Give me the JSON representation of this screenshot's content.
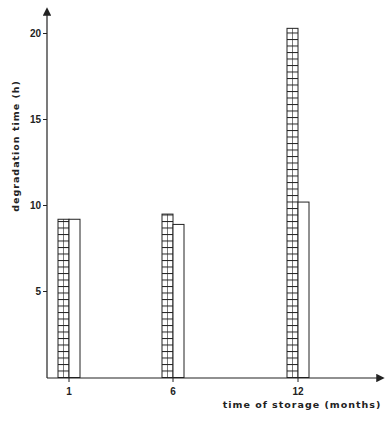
{
  "chart_data": {
    "type": "bar",
    "title": "",
    "xlabel": "time of storage (months)",
    "ylabel": "degradation time (h)",
    "categories": [
      "1",
      "6",
      "12"
    ],
    "series": [
      {
        "name": "hatched",
        "pattern": "horizontal-hatch",
        "values": [
          9.2,
          9.5,
          20.3
        ]
      },
      {
        "name": "plain",
        "pattern": "empty",
        "values": [
          9.2,
          8.9,
          10.2
        ]
      }
    ],
    "yticks": [
      5,
      10,
      15,
      20
    ],
    "ylim": [
      0,
      21
    ],
    "grid": false,
    "legend": null
  },
  "colors": {
    "ink": "#222222",
    "background": "#ffffff"
  }
}
